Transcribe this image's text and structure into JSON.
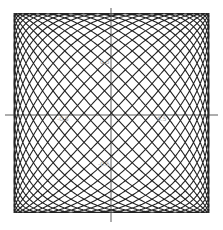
{
  "chart_data": {
    "type": "line",
    "title": "",
    "xlabel": "",
    "ylabel": "",
    "params": {
      "a": 21,
      "b": 22,
      "phase": 0
    },
    "xlim": [
      -1,
      1
    ],
    "ylim": [
      -1,
      1
    ],
    "x_ticks": [
      "-0.5",
      "0.5"
    ],
    "y_ticks": [
      "0.5",
      "-0.5"
    ],
    "grid": false,
    "legend": null,
    "line_color": "#222222"
  }
}
